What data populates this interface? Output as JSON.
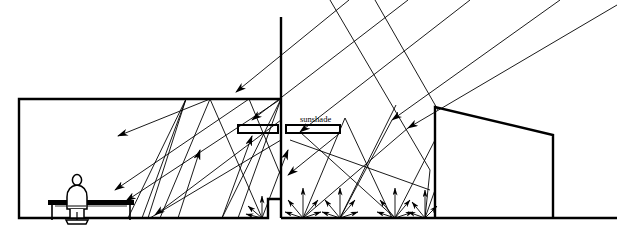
{
  "diagram": {
    "type": "architectural-section",
    "width": 617,
    "height": 240,
    "stroke_color": "#000000",
    "background_color": "#ffffff",
    "labels": [
      {
        "id": "sunshade",
        "text": "sunshade",
        "x": 300,
        "y": 122
      }
    ],
    "geometry": {
      "room": {
        "left_wall_x": 19,
        "ceiling_y": 99,
        "floor_y": 218,
        "facade_x": 281,
        "sill": {
          "x_start": 268,
          "x_end": 281,
          "top_y": 199
        }
      },
      "facade_mullion": {
        "x": 281,
        "top_y": 17,
        "bottom_y": 218
      },
      "ground": {
        "y": 218,
        "x_start": 281,
        "x_end": 617
      },
      "adjacent_building": {
        "left_x": 435,
        "right_x": 553,
        "roof_left_y": 107,
        "roof_right_y": 135,
        "base_y": 218
      },
      "sunshade_louvres": [
        {
          "x": 238,
          "y": 125,
          "w": 40,
          "h": 8
        },
        {
          "x": 286,
          "y": 125,
          "w": 54,
          "h": 8
        }
      ]
    },
    "ray_groups": {
      "incoming_sun": "rays entering from upper right",
      "ceiling_bounce": "rays reflecting off ceiling into room",
      "ground_scatter": "diffuse fans radiating from ground points"
    },
    "ground_scatter_points": [
      {
        "x": 303,
        "y": 218
      },
      {
        "x": 340,
        "y": 218
      },
      {
        "x": 395,
        "y": 218
      },
      {
        "x": 425,
        "y": 218
      }
    ]
  }
}
